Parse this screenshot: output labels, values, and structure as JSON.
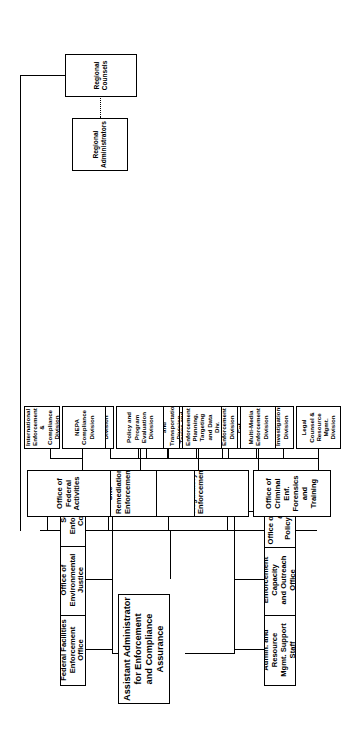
{
  "chart_title": "EPA Office of Enforcement and Compliance Assurance Organization Chart",
  "root": {
    "label": "Assistant Administrator\nfor Enforcement\nand Compliance\nAssurance",
    "line1": "Assistant Administrator",
    "line2": "for Enforcement",
    "line3": "and Compliance",
    "line4": "Assurance"
  },
  "direct_reports_top": [
    {
      "name": "federal-facilities-enforcement-office",
      "line1": "Federal Facilities",
      "line2": "Enforcement Office"
    },
    {
      "name": "office-of-environmental-justice",
      "line1": "Office of",
      "line2": "Environmental Justice"
    },
    {
      "name": "senior-enforcement-counsel",
      "line1": "Senior Enforcement",
      "line2": "Counsel"
    }
  ],
  "staff_offices": [
    {
      "name": "admin-and-resource-mgmt-support-staff",
      "line1": "Admin. and Resource",
      "line2": "Mgmt. Support Staff"
    },
    {
      "name": "enforcement-capacity-and-outreach-office",
      "line1": "Enforcement Capacity",
      "line2": "and Outreach Office"
    },
    {
      "name": "office-of-planning-and-policy-analysis",
      "line1": "Office of Planning and",
      "line2": "Policy Analysis"
    }
  ],
  "program_offices": [
    {
      "name": "office-of-criminal-enf-forensics-and-training",
      "line1": "Office of Criminal Enf.",
      "line2": "Forensics and Training",
      "divisions": [
        {
          "name": "legal-counsel-and-resource-mgmt-division",
          "line1": "Legal Counsel &",
          "line2": "Resource Mgmt. Division"
        },
        {
          "name": "criminal-investigations-division",
          "line1": "Criminal Investigations",
          "line2": "Division"
        },
        {
          "name": "national-enf-training-institute-division",
          "line1": "National Enf. Training",
          "line2": "Institute Division"
        },
        {
          "name": "national-enforcement-investigations-center",
          "line1": "National Enforcement",
          "line2": "Investigations Center"
        }
      ]
    },
    {
      "name": "office-of-regulatory-enforcement",
      "line1": "Office Of Regulatory",
      "line2": "Enforcement",
      "divisions": [
        {
          "name": "multi-media-enforcement-division",
          "line1": "Multi-Media",
          "line2": "Enforcement Division"
        },
        {
          "name": "water-enforcement-division",
          "line1": "Water Enforcement",
          "line2": "Division"
        },
        {
          "name": "toxics-and-pesticides-enforcement-division",
          "line1": "Toxics and Pesticides",
          "line2": "Enforcement Division"
        },
        {
          "name": "air-enforcement-division",
          "line1": "Air Enforcement Division",
          "line2": ""
        },
        {
          "name": "rcra-enforcement-division",
          "line1": "RCRA Enforcement",
          "line2": "Division"
        }
      ]
    },
    {
      "name": "office-of-compliance",
      "line1": "Office of Compliance",
      "line2": "",
      "divisions": [
        {
          "name": "enforcement-planning-targeting-and-data-div",
          "line1": "Enforcement Planning,",
          "line2": "Targeting and Data Div."
        },
        {
          "name": "manufacturing-energy-and-transportation-division",
          "line1": "Manufacturing, Energy",
          "line2": "and Transportation Division"
        },
        {
          "name": "chemical-commercial-services-and-municipal-div",
          "line1": "Chemical, Commercial",
          "line2": "Services and Municipal Div"
        },
        {
          "name": "agriculture-and-ecosystems-division",
          "line1": "Agriculture &",
          "line2": "Ecosystems Division"
        }
      ]
    },
    {
      "name": "office-of-site-remediation-enforcement",
      "line1": "Office of Site Remediation",
      "line2": "Enforcement",
      "divisions": [
        {
          "name": "policy-and-program-evaluation-division",
          "line1": "Policy and Program",
          "line2": "Evaluation Division"
        },
        {
          "name": "regional-support-division",
          "line1": "Regional Support",
          "line2": "Division"
        }
      ]
    },
    {
      "name": "office-of-federal-activities",
      "line1": "Office of Federal",
      "line2": "Activities",
      "divisions": [
        {
          "name": "nepa-compliance-division",
          "line1": "NEPA Compliance",
          "line2": "Division"
        },
        {
          "name": "international-enforcement-and-compliance-division",
          "line1": "International Enforcement",
          "line2": "& Compliance Division"
        }
      ]
    }
  ],
  "regional": [
    {
      "name": "regional-administrators",
      "line1": "Regional",
      "line2": "Administrators"
    },
    {
      "name": "regional-counsels",
      "line1": "Regional",
      "line2": "Counsels"
    }
  ],
  "colors": {
    "stroke": "#000000",
    "background": "#ffffff",
    "text": "#000000"
  }
}
